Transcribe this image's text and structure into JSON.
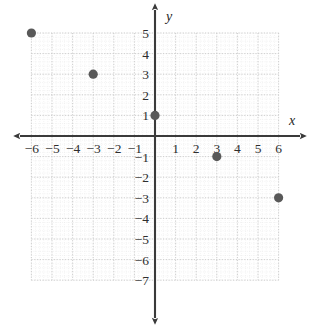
{
  "figure": {
    "kind": "coordinate-plane",
    "axis_label_x": "x",
    "axis_label_y": "y",
    "axis_color": "#3a3a3a",
    "grid_major_color": "#c9c9c9",
    "grid_minor_color": "#e2e2e2",
    "point_color": "#595959",
    "background_color": "#ffffff"
  },
  "chart_data": {
    "type": "scatter",
    "title": "",
    "xlabel": "x",
    "ylabel": "y",
    "xlim": [
      -6,
      6
    ],
    "ylim": [
      -7,
      5
    ],
    "grid": true,
    "legend": "none",
    "x_ticks": [
      -6,
      -5,
      -4,
      -3,
      -2,
      -1,
      1,
      2,
      3,
      4,
      5,
      6
    ],
    "y_ticks": [
      5,
      4,
      3,
      2,
      1,
      -1,
      -2,
      -3,
      -4,
      -5,
      -6,
      -7
    ],
    "x_tick_labels": [
      "−6",
      "−5",
      "−4",
      "−3",
      "−2",
      "−1",
      "1",
      "2",
      "3",
      "4",
      "5",
      "6"
    ],
    "y_tick_labels": [
      "5",
      "4",
      "3",
      "2",
      "1",
      "−1",
      "−2",
      "−3",
      "−4",
      "−5",
      "−6",
      "−7"
    ],
    "series": [
      {
        "name": "plotted points",
        "points": [
          {
            "x": -6,
            "y": 5
          },
          {
            "x": -3,
            "y": 3
          },
          {
            "x": 0,
            "y": 1
          },
          {
            "x": 3,
            "y": -1
          },
          {
            "x": 6,
            "y": -3
          }
        ]
      }
    ]
  }
}
